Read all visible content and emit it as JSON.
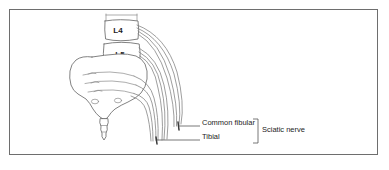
{
  "figure": {
    "type": "anatomical-diagram",
    "background_color": "#ffffff",
    "frame_color": "#6e6e6e"
  },
  "vertebrae": [
    {
      "id": "l4",
      "label": "L4"
    },
    {
      "id": "l5",
      "label": "L5"
    }
  ],
  "callouts": [
    {
      "id": "common-fibular",
      "label": "Common fibular"
    },
    {
      "id": "tibial",
      "label": "Tibial"
    }
  ],
  "grouping": {
    "bracket_label": "Sciatic nerve"
  },
  "colors": {
    "outline": "#6b6b6b",
    "detail": "#8a8a8a",
    "nerve_root": "#7d7d7d",
    "nerve_trunk": "#3a3a3a",
    "leader": "#555555",
    "text": "#1d1d1d"
  }
}
